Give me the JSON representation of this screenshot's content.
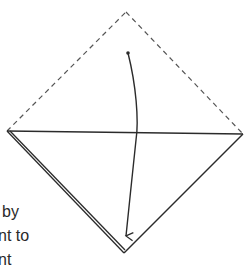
{
  "diagram": {
    "type": "origami-fold-instruction",
    "colors": {
      "line": "#2b2b2b",
      "dashed": "#555555",
      "background": "#ffffff"
    },
    "points": {
      "top_apex": [
        126,
        12
      ],
      "left_corner": [
        7,
        131
      ],
      "right_corner": [
        243,
        134
      ],
      "bottom_apex": [
        124,
        253
      ],
      "arrow_start": [
        128,
        53
      ],
      "arrow_end": [
        126,
        236
      ]
    },
    "elements": [
      {
        "name": "dashed-upper-left-edge",
        "style": "dashed"
      },
      {
        "name": "dashed-upper-right-edge",
        "style": "dashed"
      },
      {
        "name": "horizontal-diagonal-fold",
        "style": "solid"
      },
      {
        "name": "lower-left-edge-double",
        "style": "solid-double"
      },
      {
        "name": "lower-right-edge",
        "style": "solid"
      },
      {
        "name": "fold-arrow",
        "style": "curved-arrow"
      }
    ]
  },
  "text": {
    "top_fragments": [
      "t",
      ":"
    ],
    "bottom_lines": [
      "by",
      "nt to",
      "nt"
    ]
  }
}
